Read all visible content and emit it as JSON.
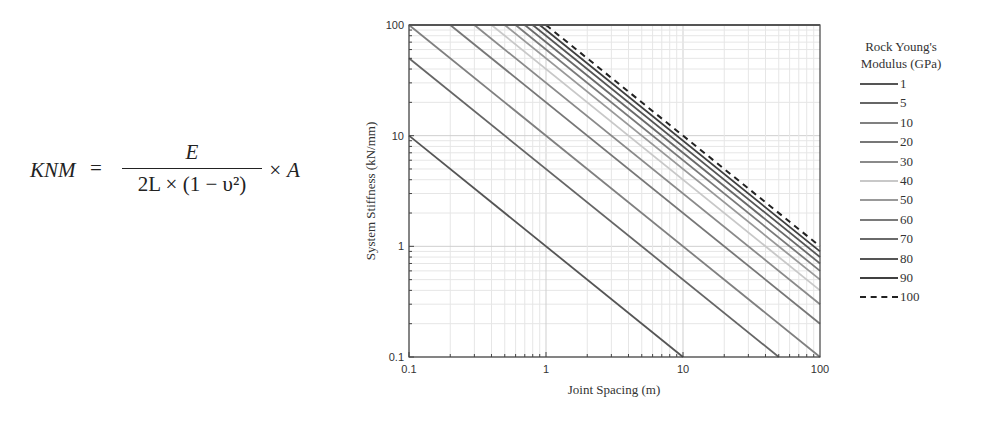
{
  "formula": {
    "lhs": "KNM",
    "equals": "=",
    "numerator": "E",
    "denominator": "2L × (1 − υ²)",
    "tail": "× A"
  },
  "chart_data": {
    "type": "line",
    "title": "",
    "xlabel": "Joint Spacing (m)",
    "ylabel": "System Stiffness (kN/mm)",
    "xscale": "log",
    "yscale": "log",
    "xlim": [
      0.1,
      100
    ],
    "ylim": [
      0.1,
      100
    ],
    "xticks": [
      "0.1",
      "1",
      "10",
      "100"
    ],
    "yticks": [
      "0.1",
      "1",
      "10",
      "100"
    ],
    "grid": true,
    "legend_title": "Rock Young's Modulus (GPa)",
    "legend_position": "right",
    "x": [
      0.1,
      0.2,
      0.5,
      1,
      2,
      5,
      10,
      20,
      50,
      100
    ],
    "relation": "stiffness ≈ E / spacing",
    "series": [
      {
        "name": "1",
        "E": 1,
        "color": "#555555",
        "dash": false,
        "values": [
          10,
          5,
          2,
          1,
          0.5,
          0.2,
          0.1,
          null,
          null,
          null
        ]
      },
      {
        "name": "5",
        "E": 5,
        "color": "#666666",
        "dash": false,
        "values": [
          50,
          25,
          10,
          5,
          2.5,
          1,
          0.5,
          0.25,
          0.1,
          null
        ]
      },
      {
        "name": "10",
        "E": 10,
        "color": "#808080",
        "dash": false,
        "values": [
          100,
          50,
          20,
          10,
          5,
          2,
          1,
          0.5,
          0.2,
          0.1
        ]
      },
      {
        "name": "20",
        "E": 20,
        "color": "#777777",
        "dash": false,
        "values": [
          null,
          100,
          40,
          20,
          10,
          4,
          2,
          1,
          0.4,
          0.2
        ]
      },
      {
        "name": "30",
        "E": 30,
        "color": "#8a8a8a",
        "dash": false,
        "values": [
          null,
          null,
          60,
          30,
          15,
          6,
          3,
          1.5,
          0.6,
          0.3
        ]
      },
      {
        "name": "40",
        "E": 40,
        "color": "#c8c8c8",
        "dash": false,
        "values": [
          null,
          null,
          80,
          40,
          20,
          8,
          4,
          2,
          0.8,
          0.4
        ]
      },
      {
        "name": "50",
        "E": 50,
        "color": "#999999",
        "dash": false,
        "values": [
          null,
          null,
          100,
          50,
          25,
          10,
          5,
          2.5,
          1,
          0.5
        ]
      },
      {
        "name": "60",
        "E": 60,
        "color": "#7a7a7a",
        "dash": false,
        "values": [
          null,
          null,
          null,
          60,
          30,
          12,
          6,
          3,
          1.2,
          0.6
        ]
      },
      {
        "name": "70",
        "E": 70,
        "color": "#6a6a6a",
        "dash": false,
        "values": [
          null,
          null,
          null,
          70,
          35,
          14,
          7,
          3.5,
          1.4,
          0.7
        ]
      },
      {
        "name": "80",
        "E": 80,
        "color": "#555555",
        "dash": false,
        "values": [
          null,
          null,
          null,
          80,
          40,
          16,
          8,
          4,
          1.6,
          0.8
        ]
      },
      {
        "name": "90",
        "E": 90,
        "color": "#404040",
        "dash": false,
        "values": [
          null,
          null,
          null,
          90,
          45,
          18,
          9,
          4.5,
          1.8,
          0.9
        ]
      },
      {
        "name": "100",
        "E": 100,
        "color": "#222222",
        "dash": true,
        "values": [
          null,
          null,
          null,
          100,
          50,
          20,
          10,
          5,
          2,
          1
        ]
      }
    ]
  },
  "legend": {
    "title_line1": "Rock Young's",
    "title_line2": "Modulus (GPa)",
    "items": [
      "1",
      "5",
      "10",
      "20",
      "30",
      "40",
      "50",
      "60",
      "70",
      "80",
      "90",
      "100"
    ]
  }
}
